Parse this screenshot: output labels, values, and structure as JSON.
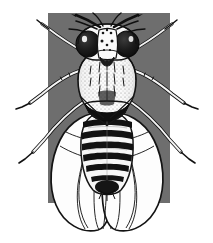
{
  "figure": {
    "title": "Drosophila melanogaster dorsal view",
    "caption": "",
    "width": 213,
    "height": 243,
    "style": "black-and-white scientific line illustration with stipple shading"
  },
  "colors": {
    "page_background": "#ffffff",
    "panel_background": "#6e6e6e",
    "ink": "#0d0d0d",
    "body_light": "#fbfbfb",
    "body_midtone": "#d6d6d6",
    "eye_dark": "#151515",
    "wing_fill": "#fdfdfd",
    "stipple": "#2a2a2a"
  },
  "panel": {
    "name": "gray-background-panel",
    "x": 48,
    "y": 13,
    "width": 122,
    "height": 190
  },
  "anatomy": {
    "head": {
      "label": "head",
      "center_x": 107,
      "center_y": 42,
      "width": 54,
      "height": 32
    },
    "eyes": {
      "label": "compound eyes",
      "count": 2,
      "left_center_x": 88,
      "right_center_x": 127,
      "center_y": 44,
      "radius_x": 12,
      "radius_y": 13,
      "color": "#151515"
    },
    "face": {
      "label": "face / frons",
      "center_x": 107,
      "center_y": 45
    },
    "antennae": {
      "label": "antennae and ocellar bristles",
      "count": 2,
      "spread_px": 70
    },
    "thorax": {
      "label": "thorax (scutum)",
      "center_x": 107,
      "center_y": 78,
      "width": 58,
      "height": 58,
      "texture": "stippled dots with median bristle rows"
    },
    "scutellum": {
      "label": "scutellum",
      "center_x": 107,
      "center_y": 110
    },
    "abdomen": {
      "label": "abdomen",
      "center_x": 107,
      "center_y": 148,
      "width": 52,
      "height": 78,
      "band_count": 6,
      "band_color": "#121212",
      "bands_y": [
        124,
        134,
        144,
        154,
        164,
        174
      ]
    },
    "wings": {
      "label": "wings",
      "count": 2,
      "left": {
        "center_x": 80,
        "center_y": 162,
        "width": 64,
        "height": 126
      },
      "right": {
        "center_x": 134,
        "center_y": 162,
        "width": 64,
        "height": 126
      },
      "vein_count": 6,
      "tip_y": 230
    },
    "legs": {
      "label": "legs",
      "count": 6,
      "pairs": [
        {
          "name": "foreleg-pair",
          "attach_y": 54
        },
        {
          "name": "midleg-pair",
          "attach_y": 82
        },
        {
          "name": "hindleg-pair",
          "attach_y": 104
        }
      ]
    }
  }
}
